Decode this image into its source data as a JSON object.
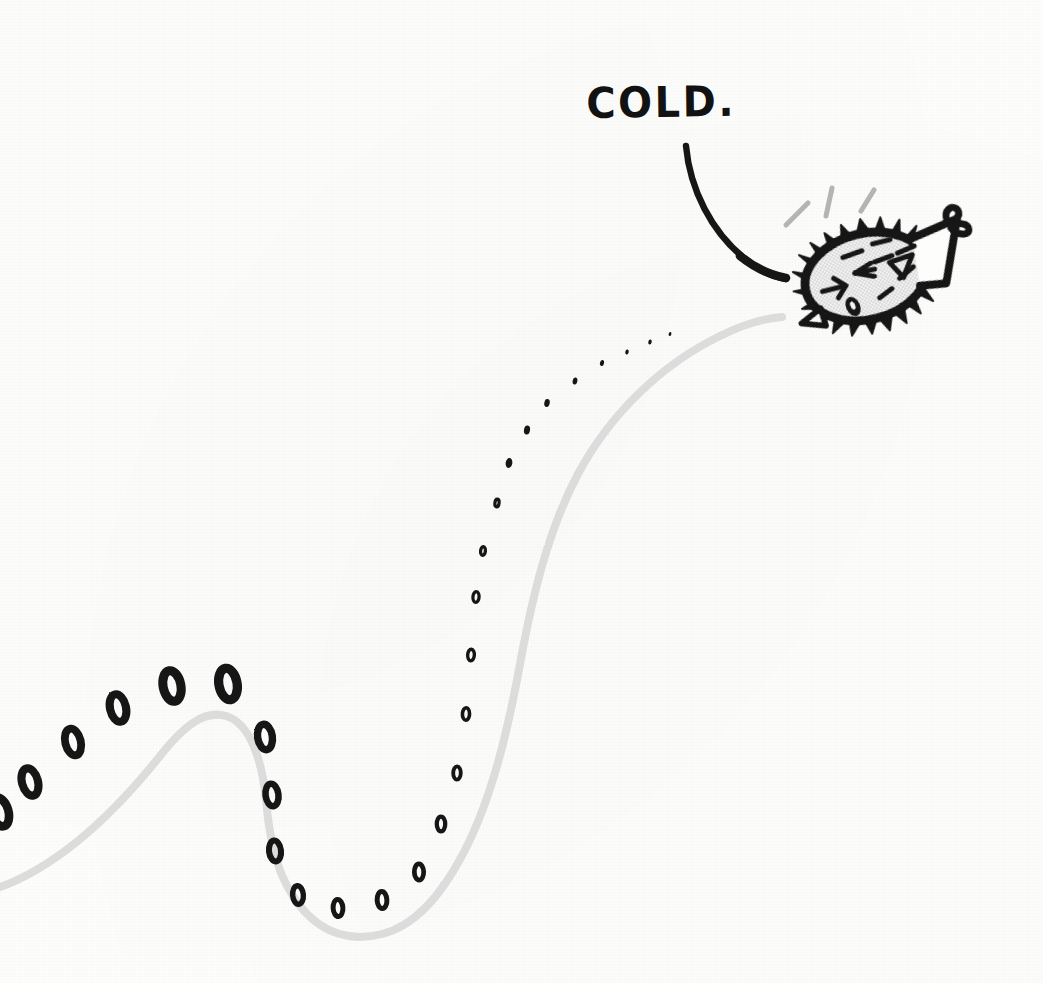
{
  "canvas": {
    "width": 1043,
    "height": 983,
    "background_color": "#fdfdfc",
    "medium": "hand-drawn ink illustration on white paper"
  },
  "palette": {
    "ink_black": "#141414",
    "body_fill_gray": "#e9e9e9",
    "trail_curve_gray": "#dcdcdc",
    "shiver_line_gray": "#bdbdbd",
    "paper_white": "#fdfdfc"
  },
  "annotation": {
    "label_text": "COLD.",
    "label_x": 586,
    "label_y": 82,
    "label_font_size_px": 40,
    "leader_line": {
      "name": "pointer-curve",
      "from_x": 686,
      "from_y": 143,
      "to_x": 788,
      "to_y": 273,
      "color": "#141414",
      "stroke_width_px": 7
    }
  },
  "creature": {
    "name": "pufferfish",
    "description": "spiky oval blowfish facing left, tail fin at right, shivering",
    "center_x": 872,
    "center_y": 273,
    "body_width_px": 150,
    "body_height_px": 92,
    "rotation_deg": -14,
    "spike_count": 26,
    "fill_color": "#e9e9e9",
    "outline_color": "#141414",
    "features": [
      "eye-arrow-mark",
      "mouth-oval",
      "pectoral-fin-triangle",
      "tail-fin",
      "body-dash-marks"
    ],
    "shiver_lines": 3
  },
  "trail": {
    "name": "bubble-zero-trail",
    "glyph": "0",
    "description": "a trail of hand-drawn zeros trailing behind the fish, growing larger with distance",
    "count": 30,
    "smallest_size_px": 4,
    "largest_size_px": 42,
    "color": "#141414"
  },
  "path": {
    "name": "swim-path",
    "description": "light gray wavy swim path entering at left edge, cresting, dipping into a trough, then rising to the fish",
    "color": "#dcdcdc",
    "stroke_width_px": 8,
    "entry_point": {
      "x": 0,
      "y": 884
    },
    "crest_point": {
      "x": 212,
      "y": 714
    },
    "trough_point": {
      "x": 357,
      "y": 934
    },
    "end_point": {
      "x": 779,
      "y": 318
    }
  },
  "chart_data": {
    "type": "scatter",
    "title": "COLD.",
    "xlabel": "",
    "ylabel": "",
    "series": [
      {
        "name": "zero-trail",
        "points": [
          {
            "x": 0,
            "y": 812,
            "size": 38
          },
          {
            "x": 30,
            "y": 782,
            "size": 36
          },
          {
            "x": 73,
            "y": 742,
            "size": 35
          },
          {
            "x": 118,
            "y": 708,
            "size": 36
          },
          {
            "x": 172,
            "y": 686,
            "size": 40
          },
          {
            "x": 228,
            "y": 684,
            "size": 41
          },
          {
            "x": 265,
            "y": 737,
            "size": 33
          },
          {
            "x": 272,
            "y": 795,
            "size": 29
          },
          {
            "x": 275,
            "y": 851,
            "size": 27
          },
          {
            "x": 298,
            "y": 895,
            "size": 24
          },
          {
            "x": 338,
            "y": 908,
            "size": 22
          },
          {
            "x": 382,
            "y": 900,
            "size": 22
          },
          {
            "x": 419,
            "y": 872,
            "size": 21
          },
          {
            "x": 441,
            "y": 824,
            "size": 19
          },
          {
            "x": 457,
            "y": 773,
            "size": 17
          },
          {
            "x": 466,
            "y": 714,
            "size": 16
          },
          {
            "x": 471,
            "y": 655,
            "size": 15
          },
          {
            "x": 476,
            "y": 597,
            "size": 14
          },
          {
            "x": 483,
            "y": 551,
            "size": 12
          },
          {
            "x": 497,
            "y": 503,
            "size": 11
          },
          {
            "x": 509,
            "y": 463,
            "size": 10
          },
          {
            "x": 527,
            "y": 430,
            "size": 9
          },
          {
            "x": 547,
            "y": 403,
            "size": 8
          },
          {
            "x": 575,
            "y": 381,
            "size": 7
          },
          {
            "x": 602,
            "y": 363,
            "size": 6
          },
          {
            "x": 627,
            "y": 352,
            "size": 5
          },
          {
            "x": 650,
            "y": 342,
            "size": 5
          },
          {
            "x": 670,
            "y": 334,
            "size": 4
          }
        ]
      }
    ]
  }
}
